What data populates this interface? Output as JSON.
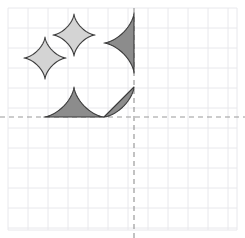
{
  "figure": {
    "title": "",
    "width": 245,
    "height": 238,
    "background_color": "#ffffff"
  },
  "grid": {
    "visible": true,
    "line_color": "#e8e8ec",
    "line_width": 1,
    "cell_size": 20,
    "x_start": 8,
    "x_end": 237,
    "y_start": 8,
    "y_end": 230,
    "x_lines": [
      8,
      28,
      48,
      68,
      88,
      108,
      128,
      148,
      168,
      188,
      208,
      228,
      237
    ],
    "y_lines": [
      8,
      28,
      48,
      68,
      88,
      108,
      128,
      148,
      168,
      188,
      208,
      228,
      230
    ]
  },
  "axes": {
    "style": "dashed",
    "color": "#9a9a9a",
    "line_width": 1.2,
    "dash_pattern": "5,4",
    "origin_x": 134,
    "origin_y": 117,
    "x_axis": {
      "label": "",
      "y": 117,
      "x_from": 0,
      "x_to": 245
    },
    "y_axis": {
      "label": "",
      "x": 134,
      "y_from": 8,
      "y_to": 238
    }
  },
  "colors": {
    "light_fill": "#d4d4d4",
    "dark_fill": "#8c8c8c",
    "outline": "#3a3a3a",
    "grid": "#e8e8ec",
    "axis": "#9a9a9a"
  },
  "shapes": [
    {
      "id": "astroid-light-upper",
      "name": "light-astroid-upper",
      "type": "astroid",
      "portion": "full",
      "fill": "#d4d4d4",
      "stroke": "#3a3a3a",
      "stroke_width": 1.1,
      "center": {
        "x": 74,
        "y": 35
      },
      "radius": 21,
      "quadrant_label": "Q2"
    },
    {
      "id": "astroid-light-lower",
      "name": "light-astroid-lower",
      "type": "astroid",
      "portion": "full",
      "fill": "#d4d4d4",
      "stroke": "#3a3a3a",
      "stroke_width": 1.1,
      "center": {
        "x": 45,
        "y": 58
      },
      "radius": 21,
      "quadrant_label": "Q2"
    },
    {
      "id": "astroid-dark-right-half",
      "name": "dark-astroid-half-at-y-axis",
      "type": "astroid",
      "portion": "left-half",
      "fill": "#8c8c8c",
      "stroke": "#3a3a3a",
      "stroke_width": 1.1,
      "center": {
        "x": 134,
        "y": 43
      },
      "radius": 30,
      "quadrant_label": "Q2"
    },
    {
      "id": "astroid-dark-top-half",
      "name": "dark-astroid-half-at-x-axis",
      "type": "astroid",
      "portion": "top-half",
      "fill": "#8c8c8c",
      "stroke": "#3a3a3a",
      "stroke_width": 1.1,
      "center": {
        "x": 74,
        "y": 117
      },
      "radius": 30,
      "quadrant_label": "Q2"
    },
    {
      "id": "astroid-dark-corner-quarter",
      "name": "dark-astroid-quarter-at-origin",
      "type": "astroid",
      "portion": "upper-left-quarter",
      "fill": "#8c8c8c",
      "stroke": "#3a3a3a",
      "stroke_width": 1.1,
      "center": {
        "x": 134,
        "y": 117
      },
      "radius": 30,
      "quadrant_label": "Q2"
    }
  ],
  "chart_data": {
    "type": "scatter",
    "title": "",
    "xlabel": "",
    "ylabel": "",
    "grid": true,
    "legend": null,
    "xlim": [
      -6.3,
      5.15
    ],
    "ylim": [
      -5.65,
      5.45
    ],
    "tick_step": 1,
    "annotations": [
      "Four-pointed star (astroid) curves drawn in the second quadrant",
      "Two light-gray full astroids, one dark half astroid tangent to the y-axis, one dark half astroid tangent to the x-axis, and one dark quarter astroid at the origin"
    ],
    "series": [
      {
        "name": "light-astroid-upper",
        "shape": "astroid",
        "fill": "#d4d4d4",
        "center_px": [
          74,
          35
        ],
        "center_units": [
          -3.0,
          4.1
        ],
        "radius_px": 21,
        "radius_units": 1.05
      },
      {
        "name": "light-astroid-lower",
        "shape": "astroid",
        "fill": "#d4d4d4",
        "center_px": [
          45,
          58
        ],
        "center_units": [
          -4.45,
          2.95
        ],
        "radius_px": 21,
        "radius_units": 1.05
      },
      {
        "name": "dark-astroid-half-at-y-axis",
        "shape": "astroid-left-half",
        "fill": "#8c8c8c",
        "center_px": [
          134,
          43
        ],
        "center_units": [
          0.0,
          3.7
        ],
        "radius_px": 30,
        "radius_units": 1.5
      },
      {
        "name": "dark-astroid-half-at-x-axis",
        "shape": "astroid-top-half",
        "fill": "#8c8c8c",
        "center_px": [
          74,
          117
        ],
        "center_units": [
          -3.0,
          0.0
        ],
        "radius_px": 30,
        "radius_units": 1.5
      },
      {
        "name": "dark-astroid-quarter-at-origin",
        "shape": "astroid-upper-left-quarter",
        "fill": "#8c8c8c",
        "center_px": [
          134,
          117
        ],
        "center_units": [
          0.0,
          0.0
        ],
        "radius_px": 30,
        "radius_units": 1.5
      }
    ]
  }
}
